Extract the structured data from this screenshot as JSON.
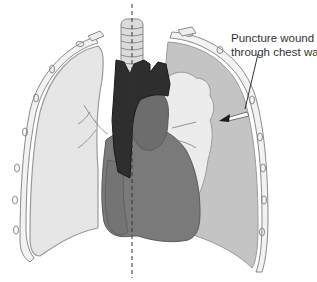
{
  "diagram": {
    "annotation": {
      "line1": "Puncture wound",
      "line2": "through chest wall"
    },
    "colors": {
      "background": "#ffffff",
      "healthy_lung": "#e6e6e6",
      "pleural_space_air": "#c4c4c4",
      "collapsed_lung": "#ececec",
      "heart": "#7a7a7a",
      "heart_dark": "#676767",
      "great_vessels": "#2e2e2e",
      "ribs_outline": "#8a8a8a",
      "trachea": "#dcdcdc",
      "midline": "#333333"
    }
  }
}
